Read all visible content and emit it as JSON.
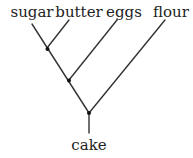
{
  "diagram": {
    "type": "tree",
    "leaves": [
      "sugar",
      "butter",
      "eggs",
      "flour"
    ],
    "root": "cake",
    "line_color": "#333333",
    "node_color": "#111111"
  }
}
